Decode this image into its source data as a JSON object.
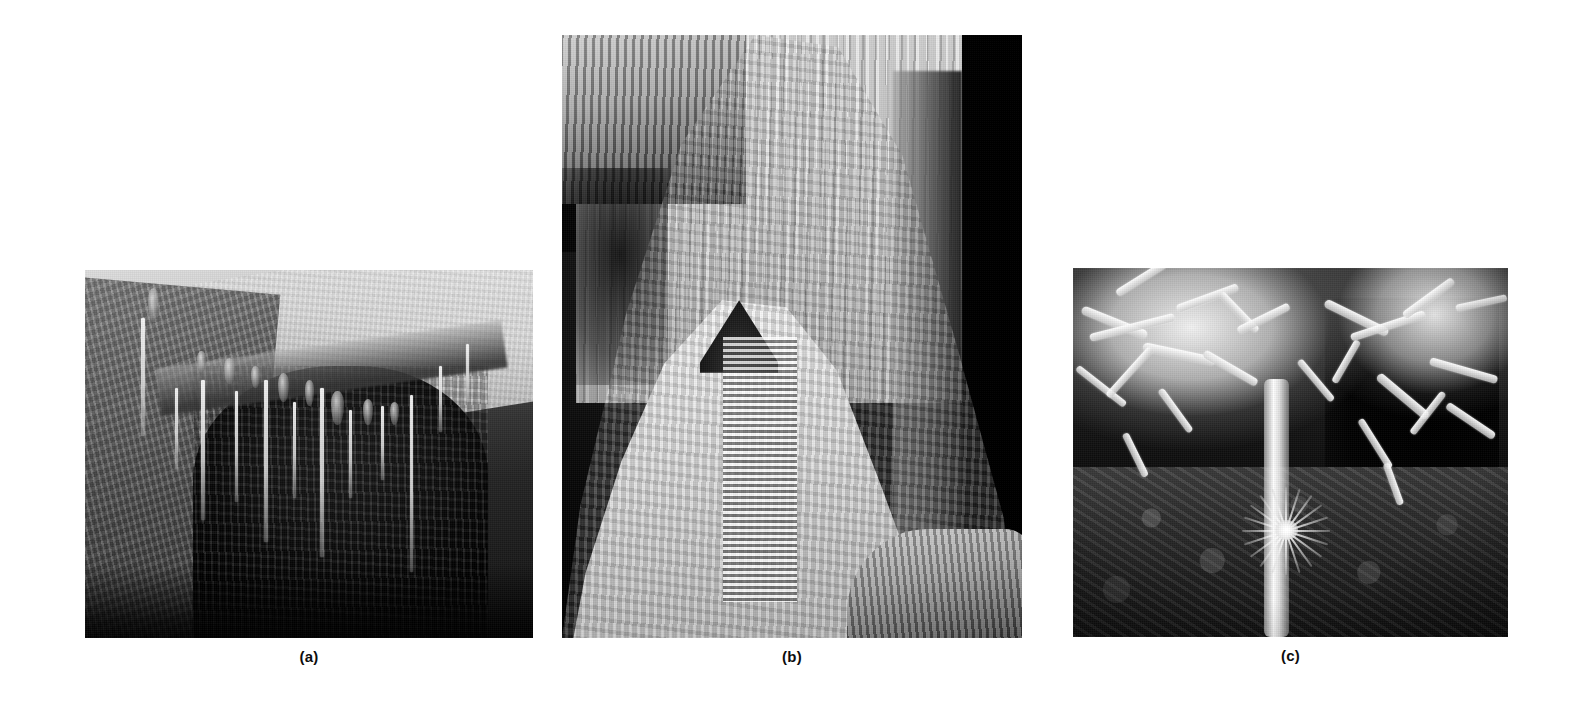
{
  "figure": {
    "background_color": "#ffffff",
    "panel_count": 3,
    "rendering": "grayscale photographic plate"
  },
  "panels": [
    {
      "id": "a",
      "caption": "(a)",
      "subject": "soda-straw stalactites hanging from a dark cave ceiling recess",
      "x": 85,
      "y": 270,
      "width": 448,
      "height": 368,
      "dominant_tone": "dark gray with pale limestone ceiling at upper right"
    },
    {
      "id": "b",
      "caption": "(b)",
      "subject": "large pale flowstone column and ribbed stalagmite against black cave void",
      "x": 562,
      "y": 35,
      "width": 460,
      "height": 603,
      "dominant_tone": "bright white calcite on black background"
    },
    {
      "id": "c",
      "caption": "(c)",
      "subject": "helictites and aragonite anthodite bushes on cave ceiling above rubble floor",
      "x": 1073,
      "y": 268,
      "width": 435,
      "height": 369,
      "dominant_tone": "white crystal sprays over dark brown soil"
    }
  ],
  "captions": {
    "a": "(a)",
    "b": "(b)",
    "c": "(c)",
    "style": "bold sans-serif, centered beneath each panel",
    "color": "#0d0d0d"
  }
}
